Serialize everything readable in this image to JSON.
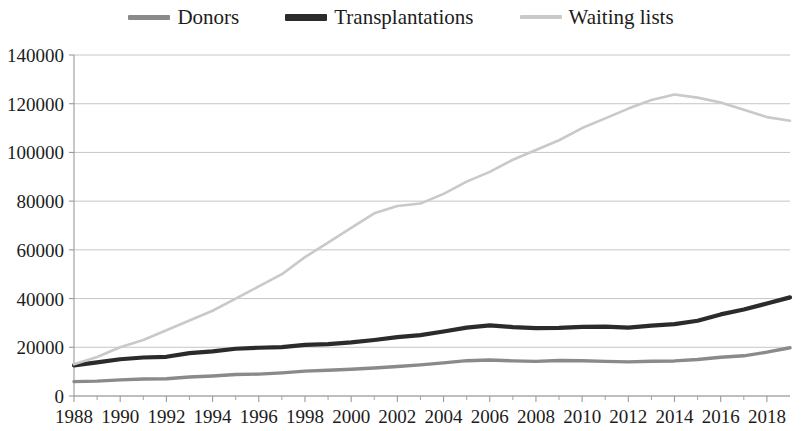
{
  "legend": {
    "entries": [
      {
        "label": "Donors",
        "color": "#8a8a8a",
        "name": "legend-donors"
      },
      {
        "label": "Transplantations",
        "color": "#2b2b2b",
        "name": "legend-transplantations"
      },
      {
        "label": "Waiting lists",
        "color": "#c9c9c9",
        "name": "legend-waiting-lists"
      }
    ]
  },
  "axes": {
    "y_ticks": [
      "0",
      "20000",
      "40000",
      "60000",
      "80000",
      "100000",
      "120000",
      "140000"
    ],
    "x_ticks": [
      "1988",
      "1990",
      "1992",
      "1994",
      "1996",
      "1998",
      "2000",
      "2002",
      "2004",
      "2006",
      "2008",
      "2010",
      "2012",
      "2014",
      "2016",
      "2018"
    ]
  },
  "chart_data": {
    "type": "line",
    "title": "",
    "xlabel": "",
    "ylabel": "",
    "xlim": [
      1988,
      2019
    ],
    "ylim": [
      0,
      140000
    ],
    "ytick_values": [
      0,
      20000,
      40000,
      60000,
      80000,
      100000,
      120000,
      140000
    ],
    "xtick_values": [
      1988,
      1990,
      1992,
      1994,
      1996,
      1998,
      2000,
      2002,
      2004,
      2006,
      2008,
      2010,
      2012,
      2014,
      2016,
      2018
    ],
    "grid": "horizontal",
    "legend_position": "top-center",
    "x": [
      1988,
      1989,
      1990,
      1991,
      1992,
      1993,
      1994,
      1995,
      1996,
      1997,
      1998,
      1999,
      2000,
      2001,
      2002,
      2003,
      2004,
      2005,
      2006,
      2007,
      2008,
      2009,
      2010,
      2011,
      2012,
      2013,
      2014,
      2015,
      2016,
      2017,
      2018,
      2019
    ],
    "series": [
      {
        "name": "Donors",
        "color": "#8a8a8a",
        "values": [
          5900,
          6100,
          6600,
          7000,
          7100,
          7800,
          8200,
          8800,
          9000,
          9500,
          10200,
          10600,
          11000,
          11500,
          12100,
          12800,
          13600,
          14500,
          14750,
          14400,
          14200,
          14600,
          14500,
          14200,
          14000,
          14250,
          14400,
          15000,
          15900,
          16500,
          18000,
          19800
        ]
      },
      {
        "name": "Transplantations",
        "color": "#2b2b2b",
        "values": [
          12600,
          13800,
          15100,
          15800,
          16100,
          17600,
          18300,
          19400,
          19800,
          20100,
          21000,
          21300,
          22000,
          23000,
          24200,
          25000,
          26500,
          28100,
          29000,
          28300,
          27900,
          28000,
          28400,
          28500,
          28100,
          28900,
          29500,
          30900,
          33500,
          35500,
          38000,
          40500
        ]
      },
      {
        "name": "Waiting lists",
        "color": "#c9c9c9",
        "values": [
          13000,
          16000,
          20000,
          23000,
          27000,
          31000,
          35000,
          40000,
          45000,
          50000,
          57000,
          63000,
          69000,
          75000,
          78000,
          79000,
          83000,
          88000,
          92000,
          97000,
          101000,
          105000,
          110000,
          114000,
          118000,
          121500,
          123800,
          122500,
          120500,
          117500,
          114500,
          113000
        ]
      }
    ]
  }
}
